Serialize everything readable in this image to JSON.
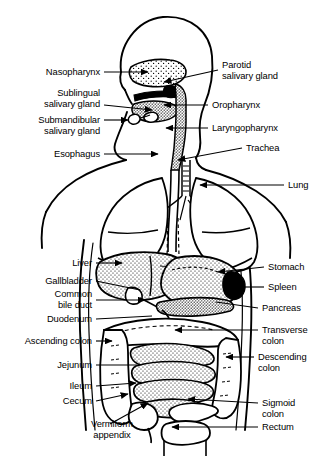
{
  "figure": {
    "type": "labeled-anatomical-diagram",
    "width": 324,
    "height": 458,
    "style": {
      "line_color": "#000000",
      "fill_color": "#ffffff",
      "background": "#ffffff",
      "organ_texture": "stipple"
    }
  },
  "labels": {
    "left": [
      {
        "id": "nasopharynx",
        "text": "Nasopharynx",
        "x": 100,
        "y": 67,
        "align": "right",
        "leader": {
          "from": [
            104,
            72
          ],
          "to": [
            148,
            72
          ],
          "arrow": true
        }
      },
      {
        "id": "sublingual-salivary-gland",
        "line1": "Sublingual",
        "line2": "salivary gland",
        "x": 100,
        "y": 88,
        "align": "right",
        "leader": {
          "from": [
            104,
            105
          ],
          "to": [
            152,
            110
          ],
          "arrow": true
        }
      },
      {
        "id": "submandibular-salivary-gland",
        "line1": "Submandibular",
        "line2": "salivary gland",
        "x": 100,
        "y": 115,
        "align": "right",
        "leader": {
          "from": [
            104,
            120
          ],
          "to": [
            128,
            120
          ],
          "arrow": true
        }
      },
      {
        "id": "esophagus",
        "text": "Esophagus",
        "x": 100,
        "y": 149,
        "align": "right",
        "leader": {
          "from": [
            104,
            154
          ],
          "to": [
            158,
            154
          ],
          "arrow": true
        }
      },
      {
        "id": "liver",
        "text": "Liver",
        "x": 92,
        "y": 258,
        "align": "right",
        "leader": {
          "from": [
            96,
            263
          ],
          "to": [
            122,
            263
          ],
          "arrow": true
        }
      },
      {
        "id": "gallbladder",
        "text": "Gallbladder",
        "x": 92,
        "y": 276,
        "align": "right",
        "leader": {
          "from": [
            96,
            281
          ],
          "to": [
            140,
            290
          ],
          "arrow": false
        }
      },
      {
        "id": "common-bile-duct",
        "line1": "Common",
        "line2": "bile duct",
        "x": 92,
        "y": 289,
        "align": "right",
        "leader": {
          "from": [
            96,
            300
          ],
          "to": [
            145,
            300
          ],
          "arrow": true
        }
      },
      {
        "id": "duodenum",
        "text": "Duodenum",
        "x": 92,
        "y": 314,
        "align": "right",
        "leader": {
          "from": [
            96,
            319
          ],
          "to": [
            152,
            316
          ],
          "arrow": false
        }
      },
      {
        "id": "ascending-colon",
        "text": "Ascending colon",
        "x": 92,
        "y": 336,
        "align": "right",
        "leader": {
          "from": [
            96,
            341
          ],
          "to": [
            112,
            341
          ],
          "arrow": true
        }
      },
      {
        "id": "jejunum",
        "text": "Jejunum",
        "x": 92,
        "y": 360,
        "align": "right",
        "leader": {
          "from": [
            96,
            365
          ],
          "to": [
            137,
            365
          ],
          "arrow": false
        }
      },
      {
        "id": "ileum",
        "text": "Ileum",
        "x": 92,
        "y": 381,
        "align": "right",
        "leader": {
          "from": [
            96,
            386
          ],
          "to": [
            136,
            383
          ],
          "arrow": true
        }
      },
      {
        "id": "cecum",
        "text": "Cecum",
        "x": 92,
        "y": 396,
        "align": "right",
        "leader": {
          "from": [
            96,
            401
          ],
          "to": [
            128,
            394
          ],
          "arrow": true
        }
      },
      {
        "id": "vermiform-appendix",
        "line1": "Vermiform",
        "line2": "appendix",
        "x": 112,
        "y": 419,
        "align": "center",
        "leader": {
          "from": [
            110,
            424
          ],
          "to": [
            148,
            403
          ],
          "arrow": true
        }
      }
    ],
    "right": [
      {
        "id": "parotid-salivary-gland",
        "line1": "Parotid",
        "line2": "salivary gland",
        "x": 222,
        "y": 60,
        "align": "left",
        "leader": {
          "from": [
            218,
            70
          ],
          "to": [
            164,
            82
          ],
          "arrow": true
        }
      },
      {
        "id": "oropharynx",
        "text": "Oropharynx",
        "x": 212,
        "y": 100,
        "align": "left",
        "leader": {
          "from": [
            208,
            105
          ],
          "to": [
            164,
            105
          ],
          "arrow": true
        }
      },
      {
        "id": "laryngopharynx",
        "text": "Laryngopharynx",
        "x": 212,
        "y": 123,
        "align": "left",
        "leader": {
          "from": [
            208,
            128
          ],
          "to": [
            166,
            128
          ],
          "arrow": true
        }
      },
      {
        "id": "trachea",
        "text": "Trachea",
        "x": 246,
        "y": 143,
        "align": "left",
        "leader": {
          "from": [
            242,
            148
          ],
          "to": [
            178,
            160
          ],
          "arrow": true
        }
      },
      {
        "id": "lung",
        "text": "Lung",
        "x": 288,
        "y": 180,
        "align": "left",
        "leader": {
          "from": [
            284,
            185
          ],
          "to": [
            200,
            185
          ],
          "arrow": true
        }
      },
      {
        "id": "stomach",
        "text": "Stomach",
        "x": 268,
        "y": 262,
        "align": "left",
        "leader": {
          "from": [
            264,
            267
          ],
          "to": [
            218,
            272
          ],
          "arrow": true
        }
      },
      {
        "id": "spleen",
        "text": "Spleen",
        "x": 268,
        "y": 282,
        "align": "left",
        "leader": {
          "from": [
            264,
            287
          ],
          "to": [
            232,
            287
          ],
          "arrow": true
        }
      },
      {
        "id": "pancreas",
        "text": "Pancreas",
        "x": 262,
        "y": 303,
        "align": "left",
        "leader": {
          "from": [
            258,
            308
          ],
          "to": [
            216,
            302
          ],
          "arrow": false
        }
      },
      {
        "id": "transverse-colon",
        "line1": "Transverse",
        "line2": "colon",
        "x": 262,
        "y": 325,
        "align": "left",
        "leader": {
          "from": [
            258,
            330
          ],
          "to": [
            175,
            330
          ],
          "arrow": true
        }
      },
      {
        "id": "descending-colon",
        "line1": "Descending",
        "line2": "colon",
        "x": 258,
        "y": 352,
        "align": "left",
        "leader": {
          "from": [
            254,
            357
          ],
          "to": [
            226,
            357
          ],
          "arrow": true
        }
      },
      {
        "id": "sigmoid-colon",
        "line1": "Sigmoid",
        "line2": "colon",
        "x": 262,
        "y": 398,
        "align": "left",
        "leader": {
          "from": [
            258,
            403
          ],
          "to": [
            188,
            399
          ],
          "arrow": true
        }
      },
      {
        "id": "rectum",
        "text": "Rectum",
        "x": 262,
        "y": 422,
        "align": "left",
        "leader": {
          "from": [
            258,
            427
          ],
          "to": [
            172,
            427
          ],
          "arrow": true
        }
      }
    ]
  },
  "structures": [
    "nasal cavity",
    "oral cavity / tongue",
    "sublingual gland",
    "submandibular gland",
    "parotid gland",
    "pharynx",
    "esophagus",
    "trachea",
    "right lung",
    "left lung",
    "liver",
    "gallbladder",
    "common bile duct",
    "stomach",
    "spleen",
    "pancreas",
    "duodenum",
    "jejunum",
    "ileum",
    "cecum",
    "vermiform appendix",
    "ascending colon",
    "transverse colon",
    "descending colon",
    "sigmoid colon",
    "rectum"
  ]
}
